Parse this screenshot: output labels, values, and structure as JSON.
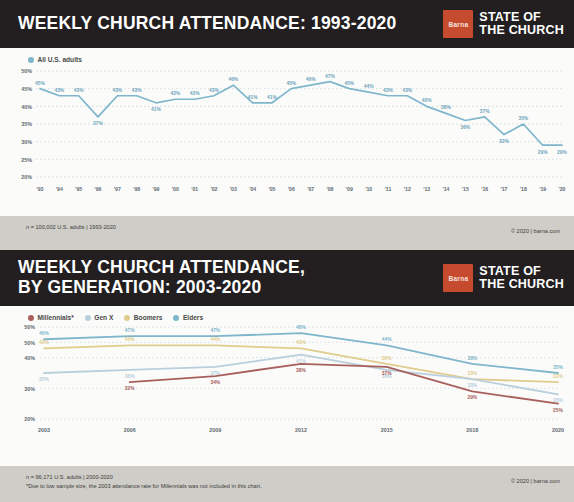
{
  "brand": {
    "mark_text": "Barna",
    "name": "STATE OF\nTHE CHURCH",
    "accent_color": "#c64a2e",
    "header_bg": "#231f20",
    "footer_bg": "#cfcdc8"
  },
  "chart1": {
    "title": "WEEKLY CHURCH ATTENDANCE: 1993-2020",
    "legend": [
      {
        "label": "All U.S. adults",
        "color": "#7fb6cc"
      }
    ],
    "footer_note": "n = 100,002 U.S. adults | 1993-2020",
    "copyright": "© 2020 | barna.com"
  },
  "chart2": {
    "title": "WEEKLY CHURCH ATTENDANCE,\nBY GENERATION: 2003-2020",
    "legend": [
      {
        "label": "Millennials*",
        "color": "#a8605d"
      },
      {
        "label": "Gen X",
        "color": "#b9cfdc"
      },
      {
        "label": "Boomers",
        "color": "#e0cc8c"
      },
      {
        "label": "Elders",
        "color": "#7fb6cc"
      }
    ],
    "footer_note": "n = 96,171 U.S. adults | 2000-2020",
    "footer_disclaimer": "*Due to low sample size, the 2003 attendance rate for Millennials was not included in this chart.",
    "copyright": "© 2020 | barna.com"
  },
  "chart_data": [
    {
      "type": "line",
      "title": "WEEKLY CHURCH ATTENDANCE: 1993-2020",
      "xlabel": "",
      "ylabel": "",
      "ylim": [
        20,
        50
      ],
      "yticks": [
        "20%",
        "25%",
        "30%",
        "35%",
        "40%",
        "45%",
        "50%"
      ],
      "ytick_values": [
        20,
        25,
        30,
        35,
        40,
        45,
        50
      ],
      "grid": true,
      "legend_position": "top-left",
      "categories": [
        "'93",
        "'94",
        "'95",
        "'96",
        "'97",
        "'98",
        "'99",
        "'00",
        "'01",
        "'02",
        "'03",
        "'04",
        "'05",
        "'06",
        "'07",
        "'08",
        "'09",
        "'10",
        "'11",
        "'12",
        "'13",
        "'14",
        "'15",
        "'16",
        "'17",
        "'18",
        "'19",
        "'20"
      ],
      "series": [
        {
          "name": "All U.S. adults",
          "color": "#7fb6cc",
          "values": [
            45,
            43,
            43,
            37,
            43,
            43,
            41,
            42,
            42,
            43,
            46,
            41,
            41,
            45,
            46,
            47,
            45,
            44,
            43,
            43,
            40,
            38,
            36,
            37,
            32,
            35,
            29,
            29
          ],
          "labels": [
            "45%",
            "43%",
            "43%",
            "37%",
            "43%",
            "43%",
            "41%",
            "42%",
            "42%",
            "43%",
            "46%",
            "41%",
            "41%",
            "45%",
            "46%",
            "47%",
            "45%",
            "44%",
            "43%",
            "43%",
            "40%",
            "38%",
            "36%",
            "37%",
            "32%",
            "35%",
            "29%",
            "29%"
          ]
        }
      ]
    },
    {
      "type": "line",
      "title": "WEEKLY CHURCH ATTENDANCE, BY GENERATION: 2003-2020",
      "xlabel": "",
      "ylabel": "",
      "ylim": [
        20,
        50
      ],
      "yticks": [
        "20%",
        "30%",
        "40%",
        "50%",
        "50%"
      ],
      "ytick_values": [
        20,
        30,
        40,
        45,
        50
      ],
      "grid": true,
      "legend_position": "top-left",
      "categories": [
        "2003",
        "2006",
        "2009",
        "2012",
        "2015",
        "2018",
        "2020"
      ],
      "series": [
        {
          "name": "Elders",
          "color": "#7fb6cc",
          "values": [
            46,
            47,
            47,
            48,
            44,
            38,
            35
          ],
          "labels": [
            "46%",
            "47%",
            "47%",
            "48%",
            "44%",
            "38%",
            "35%"
          ]
        },
        {
          "name": "Boomers",
          "color": "#e0cc8c",
          "values": [
            43,
            44,
            44,
            43,
            38,
            33,
            32
          ],
          "labels": [
            "43%",
            "44%",
            "44%",
            "43%",
            "38%",
            "33%",
            "32%"
          ]
        },
        {
          "name": "Gen X",
          "color": "#b9cfdc",
          "values": [
            35,
            36,
            37,
            41,
            36,
            33,
            28
          ],
          "labels": [
            "35%",
            "36%",
            "37%",
            "41%",
            "36%",
            "33%",
            "28%"
          ]
        },
        {
          "name": "Millennials*",
          "color": "#a8605d",
          "values": [
            null,
            32,
            34,
            38,
            37,
            29,
            25
          ],
          "labels": [
            "",
            "32%",
            "34%",
            "38%",
            "37%",
            "29%",
            "25%"
          ]
        }
      ]
    }
  ]
}
